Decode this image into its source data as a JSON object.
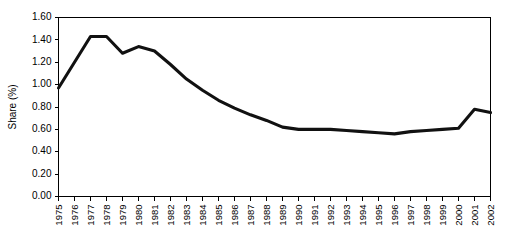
{
  "chart_data": {
    "type": "line",
    "title": "",
    "xlabel": "",
    "ylabel": "Share (%)",
    "ylim": [
      0.0,
      1.6
    ],
    "ytick_labels": [
      "0.00",
      "0.20",
      "0.40",
      "0.60",
      "0.80",
      "1.00",
      "1.20",
      "1.40",
      "1.60"
    ],
    "ytick_values": [
      0.0,
      0.2,
      0.4,
      0.6,
      0.8,
      1.0,
      1.2,
      1.4,
      1.6
    ],
    "grid": false,
    "legend": false,
    "legend_position": "none",
    "categories": [
      "1975",
      "1976",
      "1977",
      "1978",
      "1979",
      "1980",
      "1981",
      "1982",
      "1983",
      "1984",
      "1985",
      "1986",
      "1987",
      "1988",
      "1989",
      "1990",
      "1991",
      "1992",
      "1993",
      "1994",
      "1995",
      "1996",
      "1997",
      "1998",
      "1999",
      "2000",
      "2001",
      "2002"
    ],
    "series": [
      {
        "name": "Share",
        "color": "#111111",
        "values": [
          0.97,
          1.2,
          1.43,
          1.43,
          1.28,
          1.34,
          1.3,
          1.18,
          1.05,
          0.95,
          0.86,
          0.79,
          0.73,
          0.68,
          0.62,
          0.6,
          0.6,
          0.6,
          0.59,
          0.58,
          0.57,
          0.56,
          0.58,
          0.59,
          0.6,
          0.61,
          0.78,
          0.75
        ]
      }
    ]
  }
}
